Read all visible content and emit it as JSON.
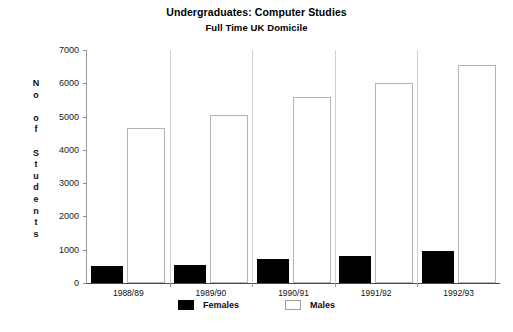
{
  "chart_data": {
    "type": "bar",
    "title": "Undergraduates: Computer Studies",
    "subtitle": "Full Time  UK Domicile",
    "xlabel": "",
    "ylabel": "No of Students",
    "ylim": [
      0,
      7000
    ],
    "ytick_step": 1000,
    "yticks": [
      0,
      1000,
      2000,
      3000,
      4000,
      5000,
      6000,
      7000
    ],
    "ytick_labels": [
      "0",
      "1000",
      "2000",
      "3000",
      "4000",
      "5000",
      "6000",
      "7000"
    ],
    "grid": false,
    "legend_position": "bottom",
    "categories": [
      "1988/89",
      "1989/90",
      "1990/91",
      "1991/92",
      "1992/93"
    ],
    "series": [
      {
        "name": "Females",
        "color": "#000000",
        "values": [
          500,
          540,
          720,
          800,
          960
        ]
      },
      {
        "name": "Males",
        "color": "#ffffff",
        "values": [
          4650,
          5050,
          5580,
          6000,
          6550
        ]
      }
    ]
  },
  "legend": {
    "items": [
      {
        "label": "Females",
        "style": "females"
      },
      {
        "label": "Males",
        "style": "males"
      }
    ]
  },
  "ylabel_letters": [
    "N",
    "o",
    "",
    "o",
    "f",
    "",
    "S",
    "t",
    "u",
    "d",
    "e",
    "n",
    "t",
    "s"
  ]
}
